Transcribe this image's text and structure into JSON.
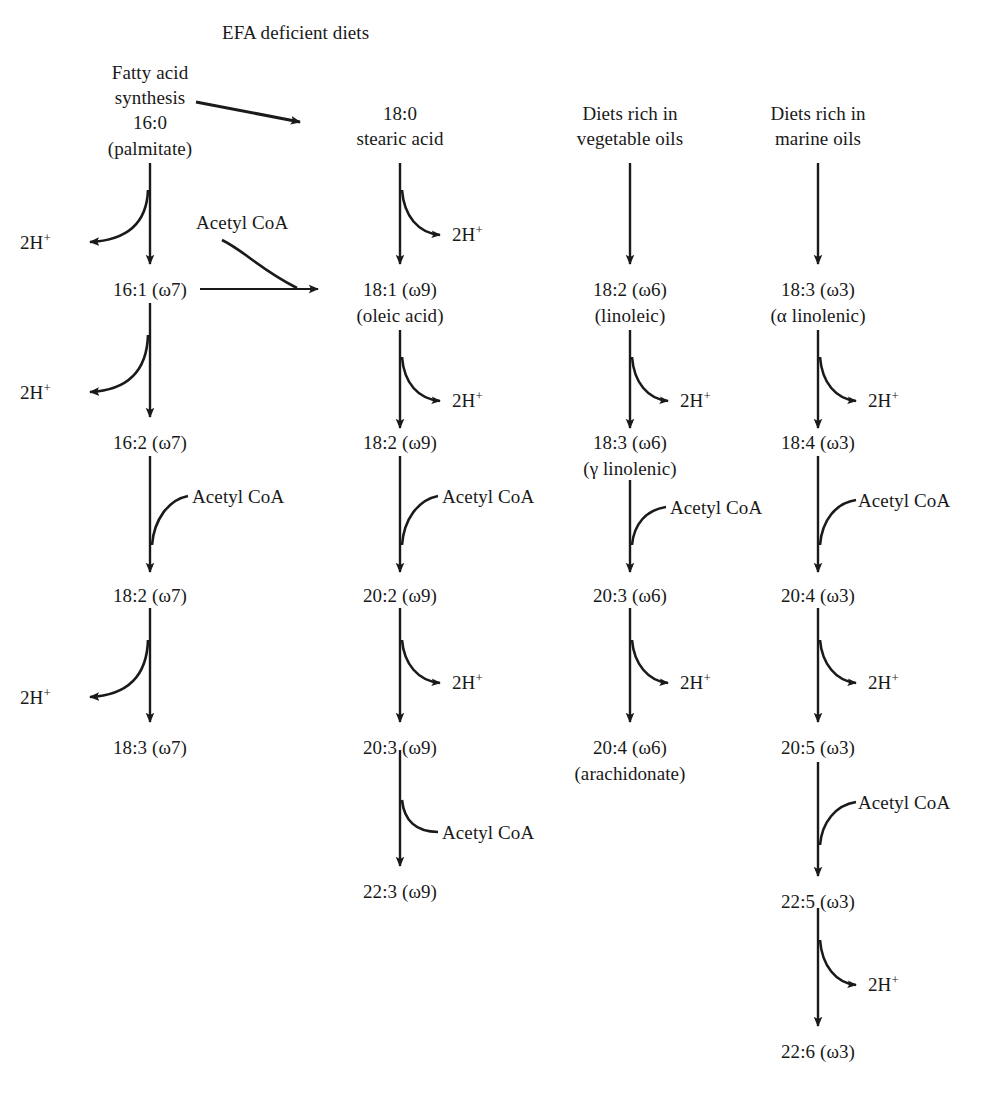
{
  "diagram": {
    "title": "EFA deficient diets",
    "stroke_color": "#1a1a1a",
    "background": "#ffffff",
    "cofactor_label": "Acetyl CoA",
    "proton_label": "2H",
    "proton_superscript": "+",
    "columns": [
      {
        "id": "omega7",
        "header_lines": [
          "Fatty acid",
          "synthesis"
        ],
        "nodes": [
          {
            "line1": "16:0",
            "line2": "(palmitate)"
          },
          {
            "line1": "16:1 (ω7)",
            "line2": ""
          },
          {
            "line1": "16:2 (ω7)",
            "line2": ""
          },
          {
            "line1": "18:2 (ω7)",
            "line2": ""
          },
          {
            "line1": "18:3 (ω7)",
            "line2": ""
          }
        ],
        "steps": [
          {
            "type": "desaturation",
            "byproduct": "2H+",
            "side": "left"
          },
          {
            "type": "desaturation",
            "byproduct": "2H+",
            "side": "left"
          },
          {
            "type": "elongation",
            "cofactor": "Acetyl CoA",
            "side": "right"
          },
          {
            "type": "desaturation",
            "byproduct": "2H+",
            "side": "left"
          }
        ]
      },
      {
        "id": "omega9",
        "header_lines": [
          "18:0",
          "stearic acid"
        ],
        "nodes": [
          {
            "line1": "18:1 (ω9)",
            "line2": "(oleic acid)"
          },
          {
            "line1": "18:2 (ω9)",
            "line2": ""
          },
          {
            "line1": "20:2 (ω9)",
            "line2": ""
          },
          {
            "line1": "20:3 (ω9)",
            "line2": ""
          },
          {
            "line1": "22:3 (ω9)",
            "line2": ""
          }
        ],
        "steps": [
          {
            "type": "desaturation",
            "byproduct": "2H+",
            "side": "right"
          },
          {
            "type": "desaturation",
            "byproduct": "2H+",
            "side": "right"
          },
          {
            "type": "elongation",
            "cofactor": "Acetyl CoA",
            "side": "right"
          },
          {
            "type": "desaturation",
            "byproduct": "2H+",
            "side": "right"
          },
          {
            "type": "elongation",
            "cofactor": "Acetyl CoA",
            "side": "right"
          }
        ]
      },
      {
        "id": "omega6",
        "header_lines": [
          "Diets rich in",
          "vegetable oils"
        ],
        "nodes": [
          {
            "line1": "18:2 (ω6)",
            "line2": "(linoleic)"
          },
          {
            "line1": "18:3 (ω6)",
            "line2": "(γ linolenic)"
          },
          {
            "line1": "20:3 (ω6)",
            "line2": ""
          },
          {
            "line1": "20:4 (ω6)",
            "line2": "(arachidonate)"
          }
        ],
        "steps": [
          {
            "type": "desaturation",
            "byproduct": "2H+",
            "side": "right"
          },
          {
            "type": "elongation",
            "cofactor": "Acetyl CoA",
            "side": "right"
          },
          {
            "type": "desaturation",
            "byproduct": "2H+",
            "side": "right"
          }
        ]
      },
      {
        "id": "omega3",
        "header_lines": [
          "Diets rich in",
          "marine oils"
        ],
        "nodes": [
          {
            "line1": "18:3 (ω3)",
            "line2": "(α linolenic)"
          },
          {
            "line1": "18:4 (ω3)",
            "line2": ""
          },
          {
            "line1": "20:4 (ω3)",
            "line2": ""
          },
          {
            "line1": "20:5 (ω3)",
            "line2": ""
          },
          {
            "line1": "22:5 (ω3)",
            "line2": ""
          },
          {
            "line1": "22:6 (ω3)",
            "line2": ""
          }
        ],
        "steps": [
          {
            "type": "desaturation",
            "byproduct": "2H+",
            "side": "right"
          },
          {
            "type": "elongation",
            "cofactor": "Acetyl CoA",
            "side": "right"
          },
          {
            "type": "desaturation",
            "byproduct": "2H+",
            "side": "right"
          },
          {
            "type": "elongation",
            "cofactor": "Acetyl CoA",
            "side": "right"
          },
          {
            "type": "desaturation",
            "byproduct": "2H+",
            "side": "right"
          }
        ]
      }
    ],
    "cross_links": [
      {
        "from": "Fatty acid synthesis",
        "to": "18:0 stearic acid",
        "style": "diagonal"
      },
      {
        "from": "16:1 (ω7)",
        "to": "18:1 (ω9)",
        "style": "horizontal",
        "cofactor": "Acetyl CoA"
      }
    ]
  },
  "labels": {
    "efa_title": "EFA deficient diets",
    "c1_head1": "Fatty acid",
    "c1_head2": "synthesis",
    "c1_n0a": "16:0",
    "c1_n0b": "(palmitate)",
    "c1_n1": "16:1 (ω7)",
    "c1_n2": "16:2 (ω7)",
    "c1_n3": "18:2 (ω7)",
    "c1_n4": "18:3 (ω7)",
    "c2_head1": "18:0",
    "c2_head2": "stearic acid",
    "c2_n0a": "18:1 (ω9)",
    "c2_n0b": "(oleic acid)",
    "c2_n1": "18:2 (ω9)",
    "c2_n2": "20:2 (ω9)",
    "c2_n3": "20:3 (ω9)",
    "c2_n4": "22:3 (ω9)",
    "c3_head1": "Diets rich in",
    "c3_head2": "vegetable oils",
    "c3_n0a": "18:2 (ω6)",
    "c3_n0b": "(linoleic)",
    "c3_n1a": "18:3 (ω6)",
    "c3_n1b": "(γ linolenic)",
    "c3_n2": "20:3 (ω6)",
    "c3_n3a": "20:4 (ω6)",
    "c3_n3b": "(arachidonate)",
    "c4_head1": "Diets rich in",
    "c4_head2": "marine oils",
    "c4_n0a": "18:3 (ω3)",
    "c4_n0b": "(α linolenic)",
    "c4_n1": "18:4 (ω3)",
    "c4_n2": "20:4 (ω3)",
    "c4_n3": "20:5 (ω3)",
    "c4_n4": "22:5 (ω3)",
    "c4_n5": "22:6 (ω3)",
    "h_a": "2H",
    "h_b": "2H",
    "h_c": "2H",
    "h_d": "2H",
    "h_e": "2H",
    "h_f": "2H",
    "h_g": "2H",
    "h_h": "2H",
    "h_i": "2H",
    "h_j": "2H",
    "h_k": "2H",
    "h_l": "2H",
    "h_m": "2H",
    "coa_1": "Acetyl CoA",
    "coa_2": "Acetyl CoA",
    "coa_3": "Acetyl CoA",
    "coa_4": "Acetyl CoA",
    "coa_5": "Acetyl CoA",
    "coa_6": "Acetyl CoA",
    "coa_7": "Acetyl CoA",
    "coa_8": "Acetyl CoA",
    "sup": "+"
  }
}
